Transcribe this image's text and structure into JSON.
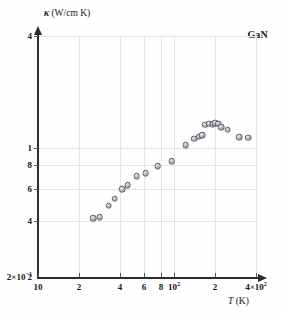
{
  "figure": {
    "sample_label": "GaN",
    "y_axis_title_symbol": "κ",
    "y_axis_title_units": "(W/cm K)",
    "x_axis_title_symbol": "T",
    "x_axis_title_units": "(K)"
  },
  "axes": {
    "x_ticks": [
      {
        "value": 10,
        "label": "10",
        "sup": ""
      },
      {
        "value": 20,
        "label": "2",
        "sup": ""
      },
      {
        "value": 40,
        "label": "4",
        "sup": ""
      },
      {
        "value": 60,
        "label": "6",
        "sup": ""
      },
      {
        "value": 80,
        "label": "8",
        "sup": ""
      },
      {
        "value": 100,
        "label": "10",
        "sup": "2"
      },
      {
        "value": 200,
        "label": "2",
        "sup": ""
      },
      {
        "value": 400,
        "label": "4×10",
        "sup": "2"
      }
    ],
    "y_ticks": [
      {
        "value": 4.0,
        "label": "4",
        "sup": ""
      },
      {
        "value": 1.0,
        "label": "1",
        "sup": ""
      },
      {
        "value": 0.8,
        "label": "8",
        "sup": ""
      },
      {
        "value": 0.6,
        "label": "6",
        "sup": ""
      },
      {
        "value": 0.4,
        "label": "4",
        "sup": ""
      },
      {
        "value": 0.2,
        "label": "2",
        "sup": ""
      },
      {
        "value": 0.2,
        "label": "2×10",
        "sup": "−1"
      }
    ]
  },
  "chart_data": {
    "type": "scatter",
    "title": "",
    "subtitle": "",
    "xlabel": "T (K)",
    "ylabel": "κ (W/cm K)",
    "xscale": "log",
    "yscale": "log",
    "xlim": [
      10,
      400
    ],
    "ylim": [
      0.2,
      4
    ],
    "grid": true,
    "legend": null,
    "annotations": [
      {
        "text": "GaN",
        "position": "top-right"
      }
    ],
    "series": [
      {
        "name": "GaN",
        "marker": "filled-grey-circle",
        "points": [
          {
            "x": 25.5,
            "y": 0.415
          },
          {
            "x": 28.5,
            "y": 0.42
          },
          {
            "x": 33.0,
            "y": 0.485
          },
          {
            "x": 36.5,
            "y": 0.53
          },
          {
            "x": 41.5,
            "y": 0.595
          },
          {
            "x": 45.5,
            "y": 0.625
          },
          {
            "x": 53.0,
            "y": 0.7
          },
          {
            "x": 62.0,
            "y": 0.725
          },
          {
            "x": 76.0,
            "y": 0.79
          },
          {
            "x": 96.0,
            "y": 0.845
          },
          {
            "x": 122.0,
            "y": 1.03
          },
          {
            "x": 140.0,
            "y": 1.115
          },
          {
            "x": 152.0,
            "y": 1.145
          },
          {
            "x": 161.0,
            "y": 1.165
          },
          {
            "x": 170.0,
            "y": 1.33
          },
          {
            "x": 182.0,
            "y": 1.345
          },
          {
            "x": 192.0,
            "y": 1.34
          },
          {
            "x": 201.0,
            "y": 1.35
          },
          {
            "x": 212.0,
            "y": 1.345
          },
          {
            "x": 222.0,
            "y": 1.285
          },
          {
            "x": 247.0,
            "y": 1.25
          },
          {
            "x": 300.0,
            "y": 1.135
          },
          {
            "x": 350.0,
            "y": 1.13
          }
        ]
      }
    ]
  }
}
